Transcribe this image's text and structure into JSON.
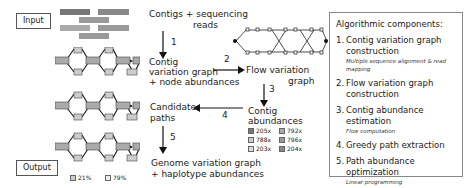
{
  "labels": {
    "input": "Input",
    "output": "Output"
  },
  "reads": [
    {
      "text": "AGTTATA",
      "shade": "#888"
    },
    {
      "text": "TCGCCAAT",
      "shade": "#888"
    },
    {
      "text": "ATAATTG",
      "shade": "#aaa"
    },
    {
      "text": "AGTAATA",
      "shade": "#aaa"
    },
    {
      "text": "TCGGAAT",
      "shade": "#999"
    },
    {
      "text": "ATACTTG",
      "shade": "#999"
    }
  ],
  "graph_nodes": [
    "AGT",
    "T",
    "A",
    "ATA",
    "A",
    "C",
    "TTG",
    "CC",
    "AAT"
  ],
  "flow": {
    "contigs_reads": "Contigs + sequencing",
    "contigs_reads_2": "reads",
    "contig_graph_1": "Contig",
    "contig_graph_2": "variation graph",
    "contig_graph_3": "+ node abundances",
    "flow_graph_1": "Flow variation",
    "flow_graph_2": "graph",
    "contig_ab_1": "Contig",
    "contig_ab_2": "abundances",
    "candidate_1": "Candidate",
    "candidate_2": "paths",
    "genome_1": "Genome variation graph",
    "genome_2": "+ haplotype abundances",
    "step1": "1",
    "step2": "2",
    "step3": "3",
    "step4": "4",
    "step5": "5"
  },
  "abundance_legend": [
    {
      "value": "205x",
      "color": "#777"
    },
    {
      "value": "792x",
      "color": "#aaa"
    },
    {
      "value": "788x",
      "color": "#ccc"
    },
    {
      "value": "796x",
      "color": "#999"
    },
    {
      "value": "203x",
      "color": "#ddd"
    },
    {
      "value": "204x",
      "color": "#888"
    }
  ],
  "output_legend": [
    {
      "value": "21%",
      "color": "#ccc"
    },
    {
      "value": "79%",
      "color": "#eee"
    }
  ],
  "panel": {
    "title": "Algorithmic components:",
    "items": [
      {
        "num": "1.",
        "label": "Contig variation graph construction",
        "sub": "Multiple sequence alignment & read mapping"
      },
      {
        "num": "2.",
        "label": "Flow variation graph construction",
        "sub": ""
      },
      {
        "num": "3.",
        "label": "Contig abundance estimation",
        "sub": "Flow computation"
      },
      {
        "num": "4.",
        "label": "Greedy path extraction",
        "sub": ""
      },
      {
        "num": "5.",
        "label": "Path abundance optimization",
        "sub": "Linear programming"
      }
    ]
  }
}
